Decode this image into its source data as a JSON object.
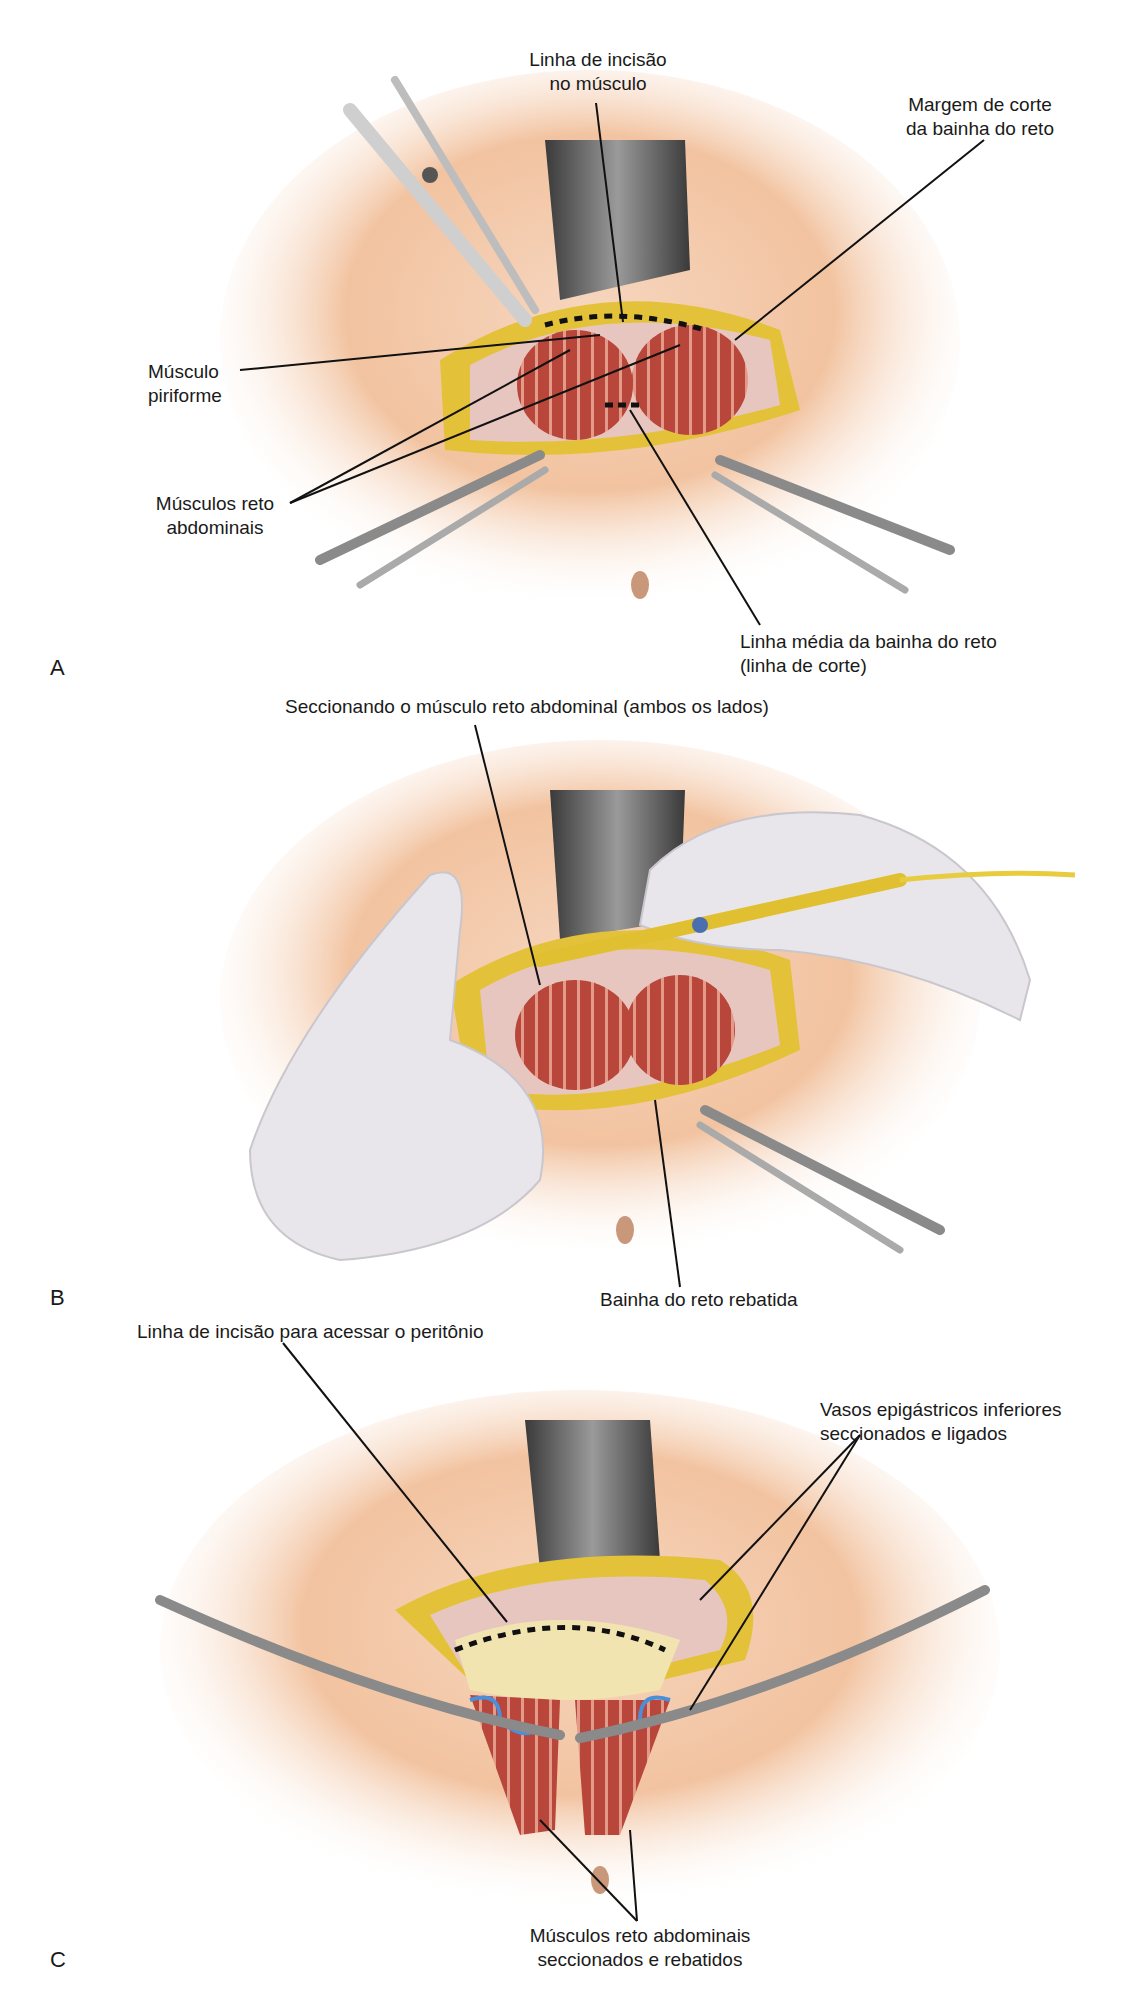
{
  "figure": {
    "panels": [
      {
        "id": "A",
        "letter": "A",
        "labels": {
          "incision_line_muscle": [
            "Linha de incisão",
            "no músculo"
          ],
          "rectus_sheath_cut_margin": [
            "Margem de corte",
            "da bainha do reto"
          ],
          "piriform_muscle": [
            "Músculo",
            "piriforme"
          ],
          "rectus_abdominis": [
            "Músculos reto",
            "abdominais"
          ],
          "rectus_sheath_midline": [
            "Linha média da bainha do reto",
            "(linha de corte)"
          ]
        }
      },
      {
        "id": "B",
        "letter": "B",
        "labels": {
          "sectioning_rectus": "Seccionando o músculo reto abdominal (ambos os lados)",
          "reflected_sheath": "Bainha do reto rebatida"
        }
      },
      {
        "id": "C",
        "letter": "C",
        "labels": {
          "peritoneum_incision": "Linha de incisão para acessar o peritônio",
          "epigastric_vessels": [
            "Vasos epigástricos inferiores",
            "seccionados e ligados"
          ],
          "rectus_sectioned": [
            "Músculos reto abdominais",
            "seccionados e rebatidos"
          ]
        }
      }
    ],
    "colors": {
      "skin": "#f3c9a8",
      "skin_light": "#fbe6d6",
      "fat": "#e3c23a",
      "muscle": "#b8463a",
      "muscle_stripe": "#e39a88",
      "fascia": "#e8c6c0",
      "retractor": "#5a5a5a",
      "glove": "#e8e6ea",
      "cautery": "#e0c030",
      "vessel_blue": "#4a8fd8",
      "peritoneum": "#f2e4b0",
      "leader_line": "#111111"
    }
  }
}
